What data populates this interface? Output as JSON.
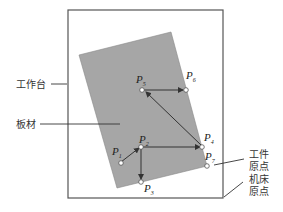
{
  "labels": {
    "worktable": "工作台",
    "sheet": "板材",
    "workpiece_origin_line1": "工件",
    "workpiece_origin_line2": "原点",
    "machine_origin_line1": "机床",
    "machine_origin_line2": "原点"
  },
  "points": [
    {
      "letter": "P",
      "sub": "1"
    },
    {
      "letter": "P",
      "sub": "2"
    },
    {
      "letter": "P",
      "sub": "3"
    },
    {
      "letter": "P",
      "sub": "4"
    },
    {
      "letter": "P",
      "sub": "5"
    },
    {
      "letter": "P",
      "sub": "6"
    },
    {
      "letter": "P",
      "sub": "7"
    }
  ],
  "colors": {
    "sheet_fill": "#a6a6a6",
    "frame_stroke": "#555555",
    "arrow": "#333333",
    "point_fill": "#ffffff"
  }
}
